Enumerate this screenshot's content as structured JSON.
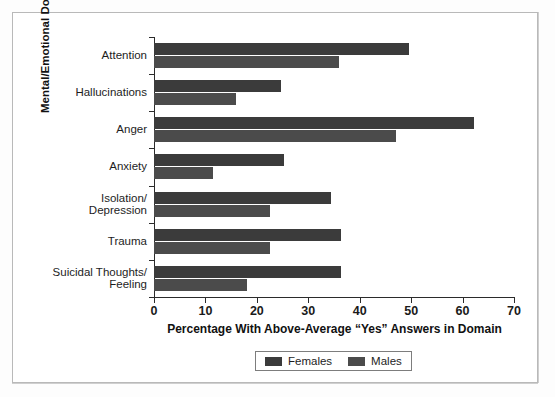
{
  "chart_data": {
    "type": "bar",
    "orientation": "horizontal",
    "title": "",
    "xlabel": "Percentage With Above-Average “Yes” Answers in Domain",
    "ylabel": "Mental/Emotional Domain",
    "categories": [
      "Attention",
      "Hallucinations",
      "Anger",
      "Anxiety",
      "Isolation/\nDepression",
      "Trauma",
      "Suicidal Thoughts/\nFeeling"
    ],
    "category_lines": [
      [
        "Attention"
      ],
      [
        "Hallucinations"
      ],
      [
        "Anger"
      ],
      [
        "Anxiety"
      ],
      [
        "Isolation/",
        "Depression"
      ],
      [
        "Trauma"
      ],
      [
        "Suicidal Thoughts/",
        "Feeling"
      ]
    ],
    "series": [
      {
        "name": "Females",
        "color": "#3b3b3b",
        "values": [
          49.5,
          24.7,
          62.2,
          25.3,
          34.4,
          36.4,
          36.4
        ]
      },
      {
        "name": "Males",
        "color": "#4b4b4b",
        "values": [
          36.0,
          16.0,
          47.0,
          11.5,
          22.6,
          22.6,
          18.0
        ]
      }
    ],
    "xlim": [
      0,
      70
    ],
    "xticks": [
      0,
      10,
      20,
      30,
      40,
      50,
      60,
      70
    ],
    "xtick_labels": [
      "0",
      "10",
      "20",
      "30",
      "40",
      "50",
      "60",
      "70"
    ],
    "grid": false,
    "legend_position": "bottom-center"
  },
  "legend": {
    "items": [
      {
        "label": "Females",
        "color": "#3b3b3b"
      },
      {
        "label": "Males",
        "color": "#4b4b4b"
      }
    ]
  },
  "colors": {
    "females": "#3b3b3b",
    "males": "#4b4b4b",
    "axis": "#2b2b2b",
    "frame": "#b9b9b9",
    "background": "#ffffff"
  }
}
